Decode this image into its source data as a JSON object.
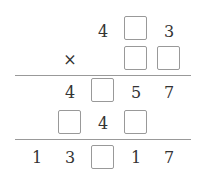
{
  "puzzle": {
    "row1": {
      "d1": "4",
      "d3": "3"
    },
    "row2": {
      "op": "×"
    },
    "row3": {
      "d1": "4",
      "d3": "5",
      "d4": "7"
    },
    "row4": {
      "d2": "4"
    },
    "row5": {
      "d1": "1",
      "d2": "3",
      "d4": "1",
      "d5": "7"
    }
  }
}
